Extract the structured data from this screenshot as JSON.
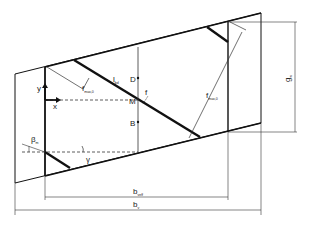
{
  "diagram": {
    "labels": {
      "l_bd": "l",
      "l_bd_sub": "bd",
      "D": "D",
      "M": "M",
      "B": "B",
      "f": "f",
      "f_max": "f",
      "f_max_sub": "max,0",
      "f_max2": "f",
      "f_max2_sub": "max,0",
      "y": "y",
      "x": "x",
      "beta": "β",
      "beta_sub": "m",
      "gamma": "γ",
      "g": "g",
      "g_sub": "w",
      "b_eff": "b",
      "b_eff_sub": "veff",
      "b_v": "b",
      "b_v_sub": "v"
    },
    "colors": {
      "line": "#111111",
      "thin": "#333333"
    }
  }
}
